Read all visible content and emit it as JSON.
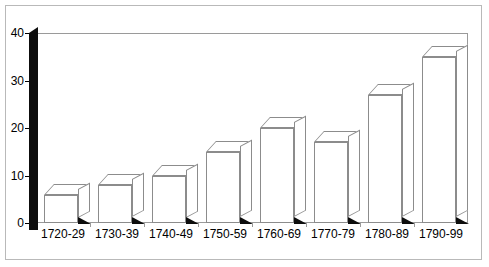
{
  "chart_data": {
    "type": "bar",
    "title": "",
    "subtitle": "",
    "xlabel": "",
    "ylabel": "",
    "categories": [
      "1720-29",
      "1730-39",
      "1740-49",
      "1750-59",
      "1760-69",
      "1770-79",
      "1780-89",
      "1790-99"
    ],
    "values": [
      6,
      8,
      10,
      15,
      20,
      17,
      27,
      35
    ],
    "yticks": [
      "0",
      "10",
      "20",
      "30",
      "40"
    ],
    "ytick_values": [
      0,
      10,
      20,
      30,
      40
    ],
    "ylim": [
      0,
      40
    ],
    "grid": false,
    "legend": false,
    "legend_position": "none",
    "style": "3d-column",
    "colors": {
      "bar_fill": "#ffffff",
      "bar_outline": "#8c8c8c",
      "axis_wall": "#0d0d0d",
      "shadow": "#0d0d0d",
      "frame": "#b9b9b9",
      "plot_border": "#9a9a9a",
      "text": "#000000",
      "background": "#ffffff"
    }
  }
}
